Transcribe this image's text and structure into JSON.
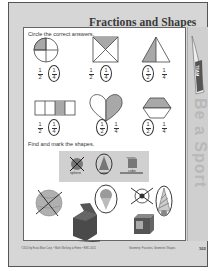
{
  "page": {
    "title": "Fractions and Shapes",
    "sidebar_text": "Be a Sport",
    "pennant_text": "TEAM",
    "footer_left": "©2010 by Evan-Moor Corp. • Math Working at Home • EMC 4011",
    "footer_right": "Geometry: Fractions, Geometric Shapes",
    "page_number": "103"
  },
  "section1": {
    "instruction": "Circle the correct answers.",
    "items": [
      {
        "shape": "circle-quarter",
        "options": [
          {
            "num": "1",
            "den": "2"
          },
          {
            "num": "1",
            "den": "4"
          }
        ],
        "circled": 1
      },
      {
        "shape": "square-quarter",
        "options": [
          {
            "num": "1",
            "den": "2"
          },
          {
            "num": "1",
            "den": "4"
          }
        ],
        "circled": 1
      },
      {
        "shape": "triangle-half",
        "options": [
          {
            "num": "1",
            "den": "2"
          },
          {
            "num": "1",
            "den": "4"
          }
        ],
        "circled": 0
      },
      {
        "shape": "bar-quarter",
        "options": [
          {
            "num": "1",
            "den": "2"
          },
          {
            "num": "1",
            "den": "4"
          }
        ],
        "circled": 1
      },
      {
        "shape": "heart-half",
        "options": [
          {
            "num": "1",
            "den": "2"
          },
          {
            "num": "1",
            "den": "4"
          }
        ],
        "circled": 0
      },
      {
        "shape": "hexagon-half",
        "options": [
          {
            "num": "1",
            "den": "2"
          },
          {
            "num": "1",
            "den": "4"
          }
        ],
        "circled": 0
      }
    ]
  },
  "section2": {
    "instruction": "Find and mark the shapes.",
    "legend": [
      {
        "label": "sphere",
        "mark": "X"
      },
      {
        "label": "cone",
        "mark": "circle"
      },
      {
        "label": "cube",
        "mark": "underline"
      }
    ],
    "pictures": [
      "globe",
      "gift-box",
      "ice-cream-cone",
      "soccer-ball",
      "party-hat",
      "alphabet-block"
    ]
  },
  "colors": {
    "page_bg": "#d6d6d6",
    "panel_bg": "#ffffff",
    "shade": "#a8a8a8",
    "ink": "#333333"
  }
}
